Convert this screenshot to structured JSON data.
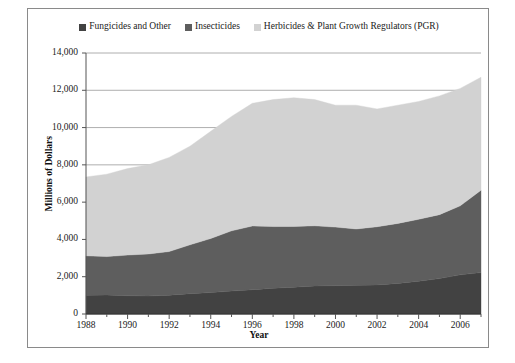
{
  "chart_data": {
    "type": "area",
    "stacked": true,
    "title": "",
    "xlabel": "Year",
    "ylabel": "Millions of Dollars",
    "xlim": [
      1988,
      2007
    ],
    "ylim": [
      0,
      14000
    ],
    "ytick_step": 2000,
    "grid": true,
    "legend_position": "top-center",
    "x": [
      1988,
      1989,
      1990,
      1991,
      1992,
      1993,
      1994,
      1995,
      1996,
      1997,
      1998,
      1999,
      2000,
      2001,
      2002,
      2003,
      2004,
      2005,
      2006,
      2007
    ],
    "xticks": [
      1988,
      1990,
      1992,
      1994,
      1996,
      1998,
      2000,
      2002,
      2004,
      2006
    ],
    "yticks": [
      "0",
      "2,000",
      "4,000",
      "6,000",
      "8,000",
      "10,000",
      "12,000",
      "14,000"
    ],
    "series": [
      {
        "name": "Fungicides and Other",
        "color": "#424242",
        "values": [
          1000,
          1020,
          980,
          960,
          1010,
          1090,
          1150,
          1230,
          1300,
          1380,
          1440,
          1500,
          1520,
          1540,
          1560,
          1640,
          1760,
          1900,
          2100,
          2220
        ]
      },
      {
        "name": "Insecticides",
        "color": "#5e5e5e",
        "values": [
          2120,
          2060,
          2180,
          2260,
          2340,
          2620,
          2900,
          3230,
          3420,
          3310,
          3260,
          3230,
          3140,
          3020,
          3120,
          3220,
          3320,
          3430,
          3700,
          4420
        ]
      },
      {
        "name": "Herbicides & Plant Growth Regulators (PGR)",
        "color": "#d2d2d2",
        "values": [
          4230,
          4420,
          4640,
          4780,
          5050,
          5290,
          5750,
          6140,
          6580,
          6810,
          6900,
          6770,
          6540,
          6640,
          6320,
          6340,
          6320,
          6370,
          6300,
          6060
        ]
      }
    ],
    "series_totals": [
      7350,
      7500,
      7800,
      8000,
      8400,
      9000,
      9800,
      10600,
      11300,
      11500,
      11600,
      11500,
      11200,
      11200,
      11000,
      11200,
      11400,
      11700,
      12100,
      12700
    ]
  },
  "legend": {
    "items": [
      {
        "label": "Fungicides and Other",
        "color": "#424242"
      },
      {
        "label": "Insecticides",
        "color": "#5e5e5e"
      },
      {
        "label": "Herbicides & Plant Growth Regulators (PGR)",
        "color": "#d2d2d2"
      }
    ]
  },
  "axes": {
    "x_title": "Year",
    "y_title": "Millions of Dollars"
  }
}
